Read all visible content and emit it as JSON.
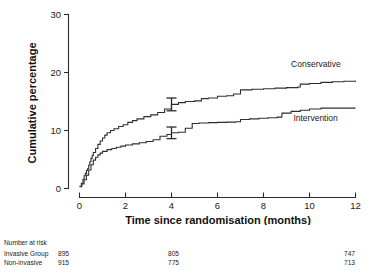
{
  "chart_data": {
    "type": "line",
    "title": "",
    "xlabel": "Time since randomisation (months)",
    "ylabel": "Cumulative percentage",
    "xlim": [
      0,
      12
    ],
    "ylim": [
      0,
      30
    ],
    "xticks": [
      0,
      2,
      4,
      6,
      8,
      10,
      12
    ],
    "yticks": [
      0,
      10,
      20,
      30
    ],
    "grid": false,
    "legend_position": "inline-annotations",
    "series": [
      {
        "name": "Conservative",
        "label_x": 9.2,
        "label_y": 21.0,
        "points": [
          [
            0.0,
            0.4
          ],
          [
            0.08,
            0.9
          ],
          [
            0.15,
            1.6
          ],
          [
            0.2,
            2.2
          ],
          [
            0.25,
            2.6
          ],
          [
            0.3,
            3.1
          ],
          [
            0.35,
            3.4
          ],
          [
            0.4,
            4.0
          ],
          [
            0.45,
            4.6
          ],
          [
            0.5,
            5.2
          ],
          [
            0.55,
            5.7
          ],
          [
            0.6,
            6.2
          ],
          [
            0.7,
            6.9
          ],
          [
            0.8,
            7.6
          ],
          [
            0.9,
            8.2
          ],
          [
            1.0,
            8.7
          ],
          [
            1.1,
            9.2
          ],
          [
            1.2,
            9.6
          ],
          [
            1.35,
            10.0
          ],
          [
            1.5,
            10.3
          ],
          [
            1.7,
            10.7
          ],
          [
            1.9,
            11.0
          ],
          [
            2.1,
            11.4
          ],
          [
            2.3,
            11.7
          ],
          [
            2.5,
            12.0
          ],
          [
            2.8,
            12.4
          ],
          [
            3.1,
            12.7
          ],
          [
            3.4,
            13.1
          ],
          [
            3.7,
            13.7
          ],
          [
            4.0,
            14.5
          ],
          [
            4.3,
            14.8
          ],
          [
            4.6,
            15.0
          ],
          [
            5.0,
            15.1
          ],
          [
            5.3,
            15.5
          ],
          [
            5.6,
            15.6
          ],
          [
            6.0,
            15.9
          ],
          [
            6.4,
            16.0
          ],
          [
            6.7,
            16.3
          ],
          [
            7.0,
            17.0
          ],
          [
            7.5,
            17.1
          ],
          [
            8.0,
            17.2
          ],
          [
            8.5,
            17.3
          ],
          [
            9.0,
            17.4
          ],
          [
            9.5,
            17.5
          ],
          [
            9.6,
            18.0
          ],
          [
            10.0,
            18.1
          ],
          [
            10.5,
            18.3
          ],
          [
            11.0,
            18.4
          ],
          [
            11.5,
            18.5
          ],
          [
            12.0,
            18.6
          ]
        ],
        "error_bar": {
          "x": 4.0,
          "y": 14.5,
          "lower": 13.4,
          "upper": 15.6
        }
      },
      {
        "name": "Intervention",
        "label_x": 9.3,
        "label_y": 11.6,
        "points": [
          [
            0.0,
            0.3
          ],
          [
            0.1,
            0.8
          ],
          [
            0.2,
            1.5
          ],
          [
            0.3,
            2.3
          ],
          [
            0.4,
            3.2
          ],
          [
            0.5,
            4.1
          ],
          [
            0.6,
            4.9
          ],
          [
            0.7,
            5.4
          ],
          [
            0.8,
            5.8
          ],
          [
            0.9,
            6.1
          ],
          [
            1.0,
            6.4
          ],
          [
            1.2,
            6.7
          ],
          [
            1.4,
            6.9
          ],
          [
            1.6,
            7.1
          ],
          [
            1.8,
            7.3
          ],
          [
            2.0,
            7.5
          ],
          [
            2.3,
            7.7
          ],
          [
            2.6,
            7.9
          ],
          [
            2.9,
            8.1
          ],
          [
            3.2,
            8.4
          ],
          [
            3.5,
            9.0
          ],
          [
            3.8,
            9.3
          ],
          [
            4.0,
            9.6
          ],
          [
            4.3,
            9.7
          ],
          [
            4.6,
            10.4
          ],
          [
            4.9,
            11.2
          ],
          [
            5.2,
            11.3
          ],
          [
            5.6,
            11.35
          ],
          [
            6.0,
            11.4
          ],
          [
            6.4,
            11.45
          ],
          [
            6.8,
            11.5
          ],
          [
            7.0,
            11.9
          ],
          [
            7.4,
            12.0
          ],
          [
            7.8,
            12.1
          ],
          [
            8.2,
            12.2
          ],
          [
            8.6,
            12.3
          ],
          [
            8.8,
            13.0
          ],
          [
            9.2,
            13.3
          ],
          [
            9.6,
            13.5
          ],
          [
            10.0,
            13.7
          ],
          [
            10.5,
            13.85
          ],
          [
            11.0,
            13.85
          ],
          [
            11.5,
            13.85
          ],
          [
            12.0,
            13.85
          ]
        ],
        "error_bar": {
          "x": 4.0,
          "y": 9.6,
          "lower": 8.6,
          "upper": 10.6
        }
      }
    ]
  },
  "axis": {
    "y_tick_labels": [
      "0",
      "10",
      "20",
      "30"
    ],
    "x_tick_labels": [
      "0",
      "2",
      "4",
      "6",
      "8",
      "10",
      "12"
    ],
    "x_title": "Time since randomisation (months)",
    "y_title": "Cumulative percentage"
  },
  "series_labels": {
    "conservative": "Conservative",
    "intervention": "Intervention"
  },
  "risk_table": {
    "caption": "Number at risk",
    "rows": [
      {
        "name": "Invasive Group",
        "v0": "895",
        "v4": "805",
        "v12": "747"
      },
      {
        "name": "Non-invasive",
        "v0": "915",
        "v4": "775",
        "v12": "713"
      }
    ]
  }
}
